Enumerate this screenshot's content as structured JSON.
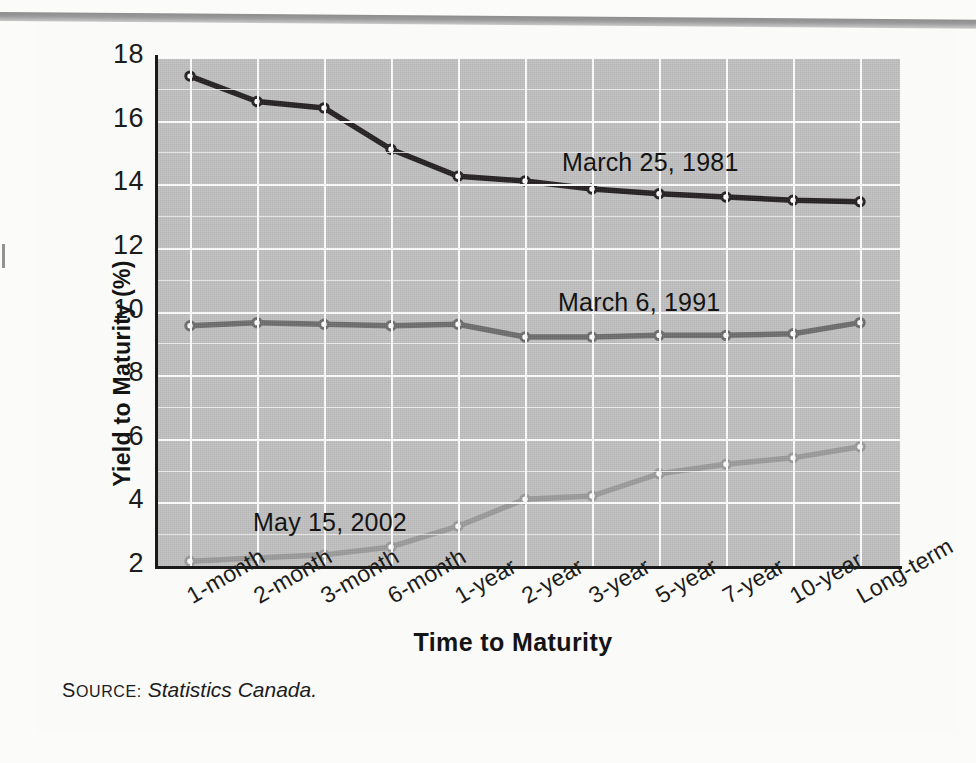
{
  "figure": {
    "source_prefix_cap": "S",
    "source_prefix_rest": "OURCE:",
    "source_value": "Statistics Canada."
  },
  "chart_data": {
    "type": "line",
    "title": "",
    "xlabel": "Time to Maturity",
    "ylabel": "Yield to Maturity (%)",
    "categories": [
      "1-month",
      "2-month",
      "3-month",
      "6-month",
      "1-year",
      "2-year",
      "3-year",
      "5-year",
      "7-year",
      "10-year",
      "Long-term"
    ],
    "ylim": [
      2,
      18
    ],
    "yticks": [
      2,
      4,
      6,
      8,
      10,
      12,
      14,
      16,
      18
    ],
    "ytick_labels": [
      "2",
      "4",
      "6",
      "8",
      "10",
      "12",
      "14",
      "16",
      "18"
    ],
    "y_minor_step": 1,
    "grid": true,
    "legend_position": "inline-annotation",
    "plot_background": "#c0c0c0",
    "series": [
      {
        "name": "March 25, 1981",
        "color": "#231f20",
        "label_x_category": "3-year",
        "values": [
          17.4,
          16.6,
          16.4,
          15.1,
          14.25,
          14.1,
          13.85,
          13.7,
          13.6,
          13.5,
          13.45
        ]
      },
      {
        "name": "March 6, 1991",
        "color": "#6d6d6d",
        "label_x_category": "3-year",
        "values": [
          9.55,
          9.65,
          9.6,
          9.55,
          9.6,
          9.2,
          9.2,
          9.25,
          9.25,
          9.3,
          9.65
        ]
      },
      {
        "name": "May 15, 2002",
        "color": "#9b9b9b",
        "label_x_category": "2-month",
        "values": [
          2.15,
          2.25,
          2.35,
          2.6,
          3.25,
          4.1,
          4.2,
          4.9,
          5.2,
          5.4,
          5.75
        ]
      }
    ]
  },
  "annotations": [
    {
      "text": "March 25, 1981",
      "left": 562,
      "top": 148
    },
    {
      "text": "March 6, 1991",
      "left": 558,
      "top": 288
    },
    {
      "text": "May 15, 2002",
      "left": 253,
      "top": 508
    }
  ]
}
